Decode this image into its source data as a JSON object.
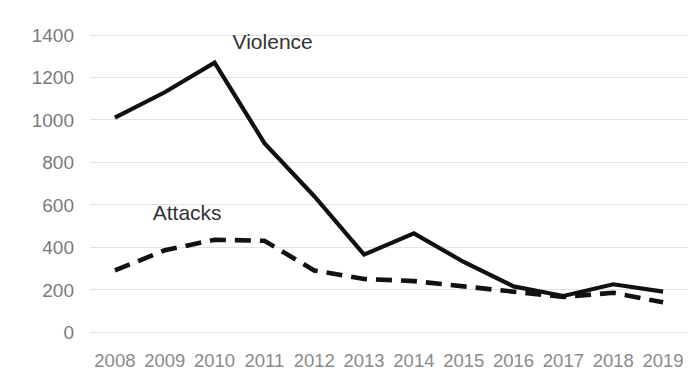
{
  "chart_data": {
    "type": "line",
    "title": "",
    "subtitle": "",
    "xlabel": "",
    "ylabel": "",
    "categories": [
      "2008",
      "2009",
      "2010",
      "2011",
      "2012",
      "2013",
      "2014",
      "2015",
      "2016",
      "2017",
      "2018",
      "2019"
    ],
    "ylim": [
      0,
      1400
    ],
    "ytick_values": [
      0,
      200,
      400,
      600,
      800,
      1000,
      1200,
      1400
    ],
    "ytick_labels": [
      "0",
      "200",
      "400",
      "600",
      "800",
      "1000",
      "1200",
      "1400"
    ],
    "grid": true,
    "grid_axis": "y",
    "legend": "inline-labels",
    "series": [
      {
        "name": "Violence",
        "style": "solid",
        "color": "#111111",
        "label_x": "2010",
        "values": [
          1010,
          1130,
          1270,
          890,
          640,
          365,
          465,
          330,
          215,
          170,
          225,
          190
        ]
      },
      {
        "name": "Attacks",
        "style": "dashed",
        "color": "#111111",
        "label_x": "2009",
        "values": [
          290,
          385,
          435,
          430,
          290,
          250,
          240,
          215,
          190,
          165,
          185,
          140
        ]
      }
    ],
    "annotations": [
      {
        "text": "Violence",
        "series": "Violence"
      },
      {
        "text": "Attacks",
        "series": "Attacks"
      }
    ]
  },
  "colors": {
    "background": "#ffffff",
    "gridline": "#e3e3e3",
    "tick_label": "#7a7a7a",
    "series_line": "#111111",
    "series_label": "#333333"
  }
}
